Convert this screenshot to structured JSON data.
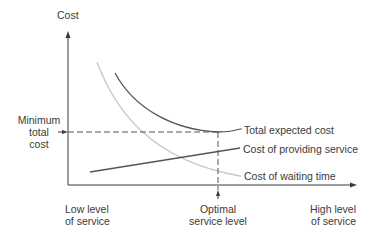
{
  "diagram": {
    "y_axis_label": "Cost",
    "min_cost_label": [
      "Minimum",
      "total",
      "cost"
    ],
    "x_low_label": [
      "Low level",
      "of service"
    ],
    "x_optimal_label": [
      "Optimal",
      "service level"
    ],
    "x_high_label": [
      "High level",
      "of service"
    ],
    "curves": {
      "total": "Total expected cost",
      "providing": "Cost of providing service",
      "waiting": "Cost of waiting time"
    },
    "colors": {
      "axis": "#3a3a3a",
      "total_curve": "#555555",
      "providing_curve": "#555555",
      "waiting_curve": "#c8c8c8"
    }
  }
}
